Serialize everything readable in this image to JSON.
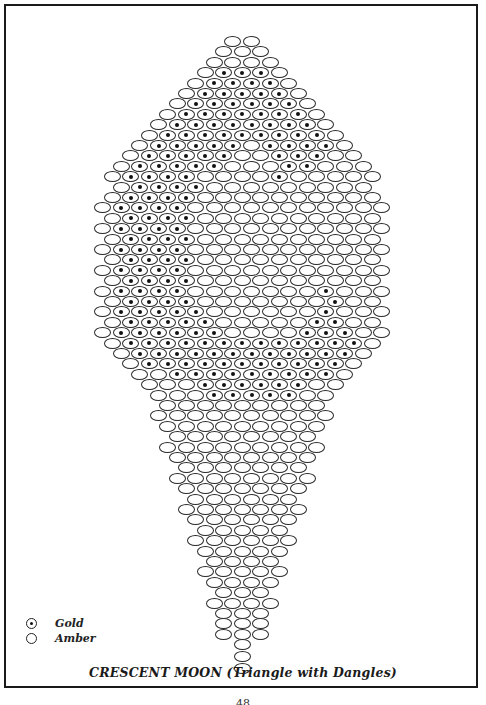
{
  "title": "CRESCENT MOON (Triangle with Dangles)",
  "page_number": "48",
  "legend": [
    {
      "symbol": "dotted-circle",
      "label": "Gold"
    },
    {
      "symbol": "empty-circle",
      "label": "Amber"
    }
  ],
  "colors": {
    "line": "#2a2a2a",
    "dot": "#111111",
    "background": "#ffffff"
  },
  "pattern": {
    "bead_pitch_x": 18.6,
    "row_pitch_y": 10.4,
    "center_x": 243,
    "top_y": 36,
    "rows": [
      {
        "count": 2,
        "gold": []
      },
      {
        "count": 3,
        "gold": []
      },
      {
        "count": 4,
        "gold": []
      },
      {
        "count": 5,
        "gold": [
          1,
          2,
          3
        ]
      },
      {
        "count": 6,
        "gold": [
          1,
          2,
          3,
          4
        ]
      },
      {
        "count": 7,
        "gold": [
          1,
          2,
          3,
          4,
          5
        ]
      },
      {
        "count": 8,
        "gold": [
          1,
          2,
          3,
          4,
          5,
          6
        ]
      },
      {
        "count": 9,
        "gold": [
          1,
          2,
          3,
          4,
          5,
          6,
          7
        ]
      },
      {
        "count": 10,
        "gold": [
          1,
          2,
          3,
          4,
          5,
          6,
          7,
          8
        ]
      },
      {
        "count": 11,
        "gold": [
          1,
          2,
          3,
          4,
          5,
          6,
          7,
          8,
          9
        ]
      },
      {
        "count": 12,
        "gold": [
          1,
          2,
          3,
          4,
          5,
          7,
          8,
          9,
          10
        ]
      },
      {
        "count": 13,
        "gold": [
          1,
          2,
          3,
          4,
          5,
          8,
          9,
          10
        ]
      },
      {
        "count": 14,
        "gold": [
          1,
          2,
          3,
          4,
          5,
          9,
          10
        ]
      },
      {
        "count": 15,
        "gold": [
          1,
          2,
          3,
          4,
          9
        ]
      },
      {
        "count": 14,
        "gold": [
          1,
          2,
          3,
          4
        ]
      },
      {
        "count": 15,
        "gold": [
          1,
          2,
          3,
          4
        ]
      },
      {
        "count": 16,
        "gold": [
          1,
          2,
          3,
          4
        ]
      },
      {
        "count": 15,
        "gold": [
          1,
          2,
          3,
          4
        ]
      },
      {
        "count": 16,
        "gold": [
          1,
          2,
          3,
          4
        ]
      },
      {
        "count": 15,
        "gold": [
          1,
          2,
          3,
          4
        ]
      },
      {
        "count": 16,
        "gold": [
          1,
          2,
          3,
          4
        ]
      },
      {
        "count": 15,
        "gold": [
          1,
          2,
          3,
          4
        ]
      },
      {
        "count": 16,
        "gold": [
          1,
          2,
          3,
          4
        ]
      },
      {
        "count": 15,
        "gold": [
          1,
          2,
          3,
          4
        ]
      },
      {
        "count": 16,
        "gold": [
          1,
          2,
          3,
          4,
          12
        ]
      },
      {
        "count": 15,
        "gold": [
          1,
          2,
          3,
          4,
          12
        ]
      },
      {
        "count": 16,
        "gold": [
          1,
          2,
          3,
          4,
          5,
          12
        ]
      },
      {
        "count": 15,
        "gold": [
          1,
          2,
          3,
          4,
          5,
          11,
          12
        ]
      },
      {
        "count": 16,
        "gold": [
          1,
          2,
          3,
          4,
          5,
          6,
          11,
          12,
          13
        ]
      },
      {
        "count": 15,
        "gold": [
          1,
          2,
          3,
          4,
          5,
          6,
          7,
          8,
          9,
          10,
          11,
          12,
          13
        ]
      },
      {
        "count": 14,
        "gold": [
          1,
          2,
          3,
          4,
          5,
          6,
          7,
          8,
          9,
          10,
          11,
          12
        ]
      },
      {
        "count": 13,
        "gold": [
          1,
          2,
          3,
          4,
          5,
          6,
          7,
          8,
          9,
          10,
          11
        ]
      },
      {
        "count": 12,
        "gold": [
          2,
          3,
          4,
          5,
          6,
          7,
          8,
          9,
          10
        ]
      },
      {
        "count": 11,
        "gold": [
          3,
          4,
          5,
          6,
          7,
          8
        ]
      },
      {
        "count": 10,
        "gold": [
          3,
          4,
          5,
          6,
          7
        ]
      },
      {
        "count": 9,
        "gold": []
      },
      {
        "count": 10,
        "gold": []
      },
      {
        "count": 9,
        "gold": []
      },
      {
        "count": 8,
        "gold": []
      },
      {
        "count": 9,
        "gold": []
      },
      {
        "count": 8,
        "gold": []
      },
      {
        "count": 7,
        "gold": []
      },
      {
        "count": 8,
        "gold": []
      },
      {
        "count": 7,
        "gold": []
      },
      {
        "count": 6,
        "gold": []
      },
      {
        "count": 7,
        "gold": []
      },
      {
        "count": 6,
        "gold": []
      },
      {
        "count": 5,
        "gold": []
      },
      {
        "count": 6,
        "gold": []
      },
      {
        "count": 5,
        "gold": []
      },
      {
        "count": 4,
        "gold": []
      },
      {
        "count": 5,
        "gold": []
      },
      {
        "count": 4,
        "gold": []
      },
      {
        "count": 3,
        "gold": []
      },
      {
        "count": 4,
        "gold": []
      },
      {
        "count": 3,
        "gold": []
      },
      {
        "count": 3,
        "gold": []
      },
      {
        "count": 3,
        "gold": []
      },
      {
        "count": 1,
        "gold": []
      },
      {
        "count": 1,
        "gold": []
      },
      {
        "count": 1,
        "gold": []
      }
    ]
  }
}
